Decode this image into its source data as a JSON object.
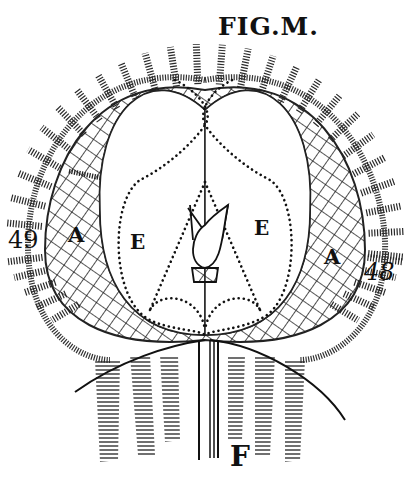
{
  "figure": {
    "title": "FIG.M.",
    "labels": {
      "left_number": "49",
      "right_number": "48",
      "left_A": "A",
      "right_A": "A",
      "left_E": "E",
      "right_E": "E",
      "bottom_F": "F"
    },
    "style": {
      "ink": "#111111",
      "paper": "#ffffff"
    }
  }
}
